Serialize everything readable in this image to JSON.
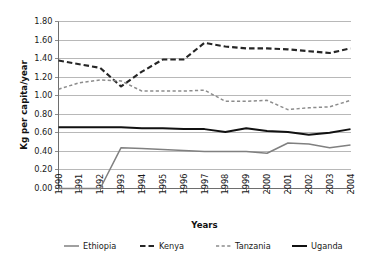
{
  "chart_data": {
    "type": "line",
    "title": "",
    "xlabel": "Years",
    "ylabel": "Kg per capita/year",
    "categories": [
      "1990",
      "1991",
      "1992",
      "1993",
      "1994",
      "1995",
      "1996",
      "1997",
      "1998",
      "1999",
      "2000",
      "2001",
      "2002",
      "2003",
      "2004"
    ],
    "x": [
      1990,
      1991,
      1992,
      1993,
      1994,
      1995,
      1996,
      1997,
      1998,
      1999,
      2000,
      2001,
      2002,
      2003,
      2004
    ],
    "xlim": [
      1990,
      2004
    ],
    "ylim": [
      0.0,
      1.8
    ],
    "ytick_labels": [
      "1.80",
      "1.60",
      "1.40",
      "1.20",
      "1.00",
      "0.80",
      "0.60",
      "0.40",
      "0.20",
      "0.00"
    ],
    "ytick_values": [
      1.8,
      1.6,
      1.4,
      1.2,
      1.0,
      0.8,
      0.6,
      0.4,
      0.2,
      0.0
    ],
    "ytick_step": 0.2,
    "grid": "horizontal",
    "legend_position": "bottom",
    "series": [
      {
        "name": "Ethiopia",
        "color": "#808080",
        "style": "solid",
        "width": 1.5,
        "values": [
          0.0,
          0.0,
          0.0,
          0.44,
          0.43,
          0.42,
          0.41,
          0.4,
          0.4,
          0.4,
          0.38,
          0.49,
          0.48,
          0.44,
          0.47
        ]
      },
      {
        "name": "Kenya",
        "color": "#262626",
        "style": "dashed",
        "width": 2.1,
        "values": [
          1.38,
          1.34,
          1.3,
          1.1,
          1.26,
          1.39,
          1.39,
          1.57,
          1.53,
          1.51,
          1.51,
          1.5,
          1.48,
          1.46,
          1.51
        ]
      },
      {
        "name": "Tanzania",
        "color": "#8c8c8c",
        "style": "fine-dashed",
        "width": 1.5,
        "values": [
          1.07,
          1.14,
          1.17,
          1.16,
          1.05,
          1.05,
          1.05,
          1.06,
          0.94,
          0.94,
          0.95,
          0.85,
          0.87,
          0.88,
          0.95
        ]
      },
      {
        "name": "Uganda",
        "color": "#111111",
        "style": "solid",
        "width": 2.0,
        "values": [
          0.66,
          0.66,
          0.66,
          0.66,
          0.65,
          0.65,
          0.64,
          0.64,
          0.61,
          0.65,
          0.62,
          0.61,
          0.58,
          0.6,
          0.64
        ]
      }
    ]
  },
  "legend": {
    "items": [
      {
        "label": "Ethiopia"
      },
      {
        "label": "Kenya"
      },
      {
        "label": "Tanzania"
      },
      {
        "label": "Uganda"
      }
    ]
  }
}
